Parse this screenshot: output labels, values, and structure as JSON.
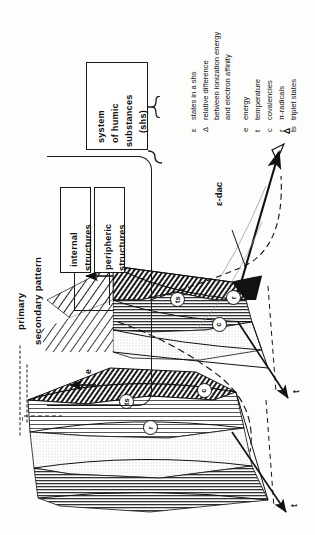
{
  "figure": {
    "orientation": "rotated-90-ccw",
    "callout": "ε-dac"
  },
  "hierarchy": {
    "root": {
      "line1": "system",
      "line2": "of humic",
      "line3": "substances",
      "line4": "(shs)"
    },
    "children": [
      {
        "line1": "internal",
        "line2": "structures"
      },
      {
        "line1": "peripheric",
        "line2": "structures"
      }
    ]
  },
  "pattern_legend": {
    "primary": "primary",
    "secondary": "secondary pattern"
  },
  "legend": {
    "entries": [
      {
        "symbol": "ε",
        "text": "states in a shs"
      },
      {
        "symbol": "Δ",
        "text": "relative difference\nbetween ionization energy\nand electron affinity"
      },
      {
        "symbol": "e",
        "text": "energy"
      },
      {
        "symbol": "t",
        "text": "temperature"
      },
      {
        "symbol": "c",
        "text": "covalencies"
      },
      {
        "symbol": "r",
        "text": "π-radicals"
      },
      {
        "symbol": "ts",
        "text": "triplet states"
      }
    ]
  },
  "axes": [
    {
      "name": "delta-axis",
      "label": "Δ"
    },
    {
      "name": "temperature-axis-upper",
      "label": "t"
    },
    {
      "name": "temperature-axis-lower",
      "label": "t"
    },
    {
      "name": "energy-arrow-upper",
      "label": "e"
    },
    {
      "name": "energy-arrow-lower",
      "label": "e"
    }
  ],
  "region_markers": [
    {
      "id": "ts-upper",
      "label": "ts"
    },
    {
      "id": "r-upper",
      "label": "r"
    },
    {
      "id": "c-upper",
      "label": "c"
    },
    {
      "id": "ts-lower",
      "label": "ts"
    },
    {
      "id": "c-lower",
      "label": "c"
    },
    {
      "id": "r-lower",
      "label": "r"
    }
  ],
  "colors": {
    "ink": "#1a1a1a",
    "paper": "#fdfdfb",
    "fill_light": "#d9d9d9",
    "fill_mid": "#b8b8b8",
    "fill_dark": "#111111"
  }
}
